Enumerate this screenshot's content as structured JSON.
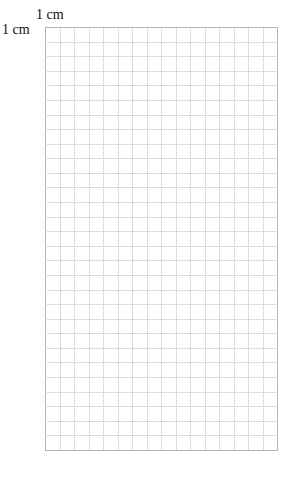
{
  "scale_labels": {
    "horizontal": "1 cm",
    "vertical": "1 cm"
  },
  "grid": {
    "columns": 16,
    "rows": 29,
    "cell_unit": "1 cm",
    "line_color": "#c8c8c8",
    "border_color": "#b4b4b4"
  }
}
